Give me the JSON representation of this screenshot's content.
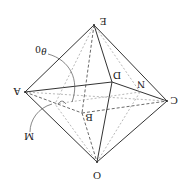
{
  "diagram": {
    "type": "octahedron-geometry",
    "orientation": "rotated 180 degrees",
    "stroke_color": "#333333",
    "dash_color": "#555555",
    "labels": {
      "E": "E",
      "A": "A",
      "C": "C",
      "O": "O",
      "D": "D",
      "B": "B",
      "N": "N",
      "M": "M",
      "theta": "θ",
      "theta_sub": "0"
    },
    "vertices": {
      "E": [
        94,
        25
      ],
      "A": [
        25,
        92
      ],
      "C": [
        167,
        101
      ],
      "O": [
        97,
        162
      ],
      "D": [
        112,
        82
      ],
      "B": [
        82,
        113
      ],
      "N": [
        140,
        92
      ],
      "M": [
        55,
        104
      ]
    }
  }
}
